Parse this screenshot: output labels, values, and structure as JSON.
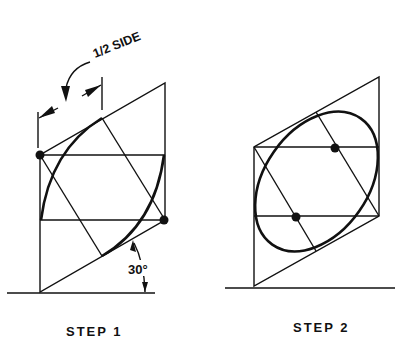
{
  "figure": {
    "step1": {
      "label": "STEP 1",
      "dimension_label": "1/2 SIDE",
      "angle_label": "30°"
    },
    "step2": {
      "label": "STEP 2"
    }
  },
  "colors": {
    "ink": "#111111",
    "background": "#ffffff"
  }
}
